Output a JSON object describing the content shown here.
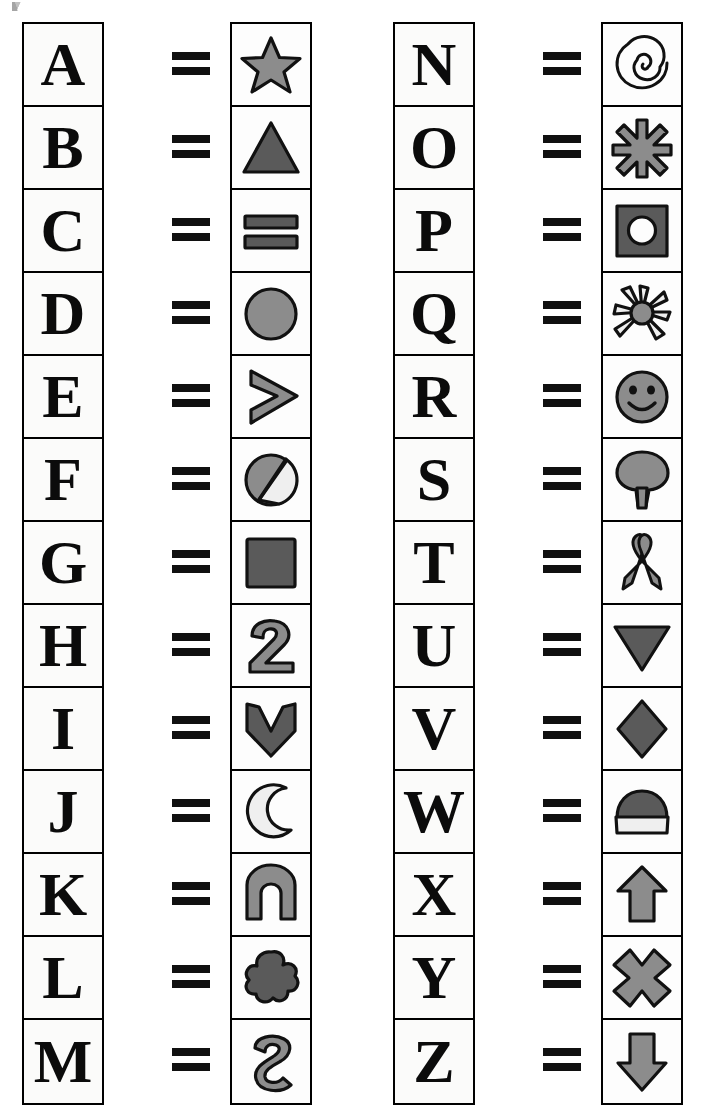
{
  "page": {
    "equals_sign": "=",
    "background_color": "#ffffff",
    "ink_color": "#0b0b0b",
    "cell_fill_color": "#fbfbfa",
    "symbol_fill_gray": "#8c8c8c",
    "symbol_fill_dark": "#5a5a5a",
    "symbol_fill_light": "#efefef"
  },
  "columns": [
    {
      "name": "left-column",
      "rows": [
        {
          "letter": "A",
          "equals": "=",
          "symbol": "star-icon",
          "symbol_label": "five-pointed star"
        },
        {
          "letter": "B",
          "equals": "=",
          "symbol": "triangle-up-icon",
          "symbol_label": "upward triangle"
        },
        {
          "letter": "C",
          "equals": "=",
          "symbol": "two-bars-icon",
          "symbol_label": "two horizontal bars"
        },
        {
          "letter": "D",
          "equals": "=",
          "symbol": "circle-icon",
          "symbol_label": "filled circle"
        },
        {
          "letter": "E",
          "equals": "=",
          "symbol": "chevron-right-icon",
          "symbol_label": "right-pointing chevron"
        },
        {
          "letter": "F",
          "equals": "=",
          "symbol": "circle-slash-icon",
          "symbol_label": "circle with diagonal slash"
        },
        {
          "letter": "G",
          "equals": "=",
          "symbol": "square-icon",
          "symbol_label": "filled square"
        },
        {
          "letter": "H",
          "equals": "=",
          "symbol": "digit-two-icon",
          "symbol_label": "numeral two"
        },
        {
          "letter": "I",
          "equals": "=",
          "symbol": "shield-notch-icon",
          "symbol_label": "downward notched shield"
        },
        {
          "letter": "J",
          "equals": "=",
          "symbol": "crescent-moon-icon",
          "symbol_label": "crescent moon"
        },
        {
          "letter": "K",
          "equals": "=",
          "symbol": "arch-icon",
          "symbol_label": "arch / inverted U"
        },
        {
          "letter": "L",
          "equals": "=",
          "symbol": "flower-blob-icon",
          "symbol_label": "five-petal flower blob"
        },
        {
          "letter": "M",
          "equals": "=",
          "symbol": "squiggle-s-icon",
          "symbol_label": "S-shaped squiggle"
        }
      ]
    },
    {
      "name": "right-column",
      "rows": [
        {
          "letter": "N",
          "equals": "=",
          "symbol": "spiral-icon",
          "symbol_label": "spiral"
        },
        {
          "letter": "O",
          "equals": "=",
          "symbol": "asterisk-icon",
          "symbol_label": "six-armed asterisk"
        },
        {
          "letter": "P",
          "equals": "=",
          "symbol": "square-hole-icon",
          "symbol_label": "square with round hole"
        },
        {
          "letter": "Q",
          "equals": "=",
          "symbol": "sun-flower-icon",
          "symbol_label": "sun with rays"
        },
        {
          "letter": "R",
          "equals": "=",
          "symbol": "smiley-face-icon",
          "symbol_label": "smiley face"
        },
        {
          "letter": "S",
          "equals": "=",
          "symbol": "tree-icon",
          "symbol_label": "tree"
        },
        {
          "letter": "T",
          "equals": "=",
          "symbol": "ribbon-icon",
          "symbol_label": "awareness ribbon"
        },
        {
          "letter": "U",
          "equals": "=",
          "symbol": "triangle-down-icon",
          "symbol_label": "downward triangle"
        },
        {
          "letter": "V",
          "equals": "=",
          "symbol": "diamond-icon",
          "symbol_label": "diamond"
        },
        {
          "letter": "W",
          "equals": "=",
          "symbol": "beanie-hat-icon",
          "symbol_label": "beanie hat"
        },
        {
          "letter": "X",
          "equals": "=",
          "symbol": "arrow-up-icon",
          "symbol_label": "upward arrow"
        },
        {
          "letter": "Y",
          "equals": "=",
          "symbol": "cross-x-icon",
          "symbol_label": "thick X cross"
        },
        {
          "letter": "Z",
          "equals": "=",
          "symbol": "arrow-down-icon",
          "symbol_label": "downward arrow"
        }
      ]
    }
  ]
}
